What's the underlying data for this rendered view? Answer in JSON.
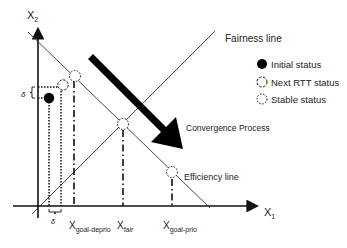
{
  "axes": {
    "x_label": "X",
    "x_sub": "1",
    "y_label": "X",
    "y_sub": "2"
  },
  "lines": {
    "fairness": "Fairness line",
    "efficiency": "Efficiency line"
  },
  "arrow": {
    "label": "Convergence Process"
  },
  "legend": {
    "items": [
      {
        "symbol": "filled-circle",
        "label": "Initial status"
      },
      {
        "symbol": "dashed-circle",
        "label": "Next RTT status"
      },
      {
        "symbol": "dotted-circle",
        "label": "Stable status"
      }
    ]
  },
  "x_ticks": [
    {
      "base": "X",
      "sub": "goal-deprio"
    },
    {
      "base": "X",
      "sub": "fair"
    },
    {
      "base": "X",
      "sub": "goal-prio"
    }
  ],
  "delta": "δ",
  "colors": {
    "ink": "#111111",
    "text": "#222222",
    "background": "#ffffff"
  }
}
